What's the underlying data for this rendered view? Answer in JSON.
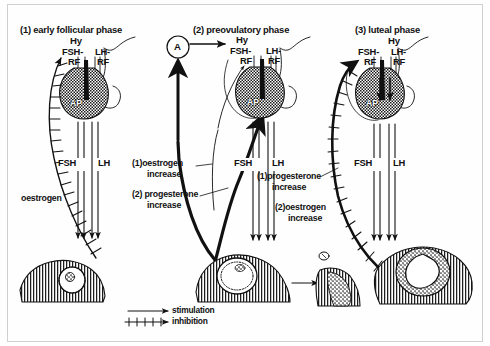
{
  "diagram": {
    "title_panels": [
      {
        "id": "panel-1",
        "label": "(1) early follicular phase"
      },
      {
        "id": "panel-2",
        "label": "(2) preovulatory phase"
      },
      {
        "id": "panel-3",
        "label": "(3) luteal phase"
      }
    ],
    "panel1": {
      "hypothalamus": "Hy",
      "fsh_rf_line1": "FSH-",
      "fsh_rf_line2": "RF",
      "lh_rf_line1": "LH-",
      "lh_rf_line2": "RF",
      "pituitary": "AP",
      "fsh": "FSH",
      "lh": "LH",
      "feedback": "oestrogen"
    },
    "panel2": {
      "node": "A",
      "hypothalamus": "Hy",
      "fsh_rf_line1": "FSH-",
      "fsh_rf_line2": "RF",
      "lh_rf_line1": "LH-",
      "lh_rf_line2": "RF",
      "pituitary": "AP",
      "fsh": "FSH",
      "lh": "LH",
      "feedback_1_line1": "(1)oestrogen",
      "feedback_1_line2": "increase",
      "feedback_2_line1": "(2) progesterone",
      "feedback_2_line2": "increase"
    },
    "panel3": {
      "hypothalamus": "Hy",
      "fsh_rf_line1": "FSH-",
      "fsh_rf_line2": "RF",
      "lh_rf_line1": "LH-",
      "lh_rf_line2": "RF",
      "pituitary": "AP",
      "fsh": "FSH",
      "lh": "LH",
      "feedback_1_line1": "(1)progesterone",
      "feedback_1_line2": "increase",
      "feedback_2_line1": "(2)oestrogen",
      "feedback_2_line2": "increase"
    },
    "legend": {
      "stimulation": "stimulation",
      "inhibition": "inhibition"
    },
    "colors": {
      "ink": "#111111",
      "paper": "#fefefe",
      "frame": "#cfcfcf"
    },
    "icons": {
      "stimulation": "plain-arrow-icon",
      "inhibition": "crosshatch-arrow-icon",
      "pituitary": "pituitary-gland-icon",
      "ovary": "ovary-icon",
      "uterus": "uterus-icon",
      "corpus_luteum": "corpus-luteum-icon",
      "ovum": "ovum-icon"
    }
  }
}
